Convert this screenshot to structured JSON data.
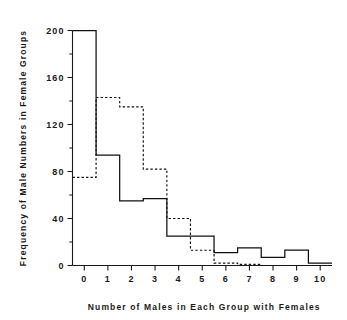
{
  "chart_data": {
    "type": "line",
    "title": "",
    "subtitle": "",
    "xlabel": "Number of Males in Each Group with Females",
    "ylabel": "Frequency of Male Numbers in Female Groups",
    "categories": [
      0,
      1,
      2,
      3,
      4,
      5,
      6,
      7,
      8,
      9,
      10
    ],
    "x": [
      0,
      1,
      2,
      3,
      4,
      5,
      6,
      7,
      8,
      9,
      10
    ],
    "xlim": [
      -0.5,
      10.5
    ],
    "ylim": [
      0,
      200
    ],
    "grid": false,
    "legend_position": "none",
    "xticks": [
      "0",
      "1",
      "2",
      "3",
      "4",
      "5",
      "6",
      "7",
      "8",
      "9",
      "10"
    ],
    "yticks": [
      "0",
      "40",
      "80",
      "120",
      "160",
      "200"
    ],
    "y_major_interval": 40,
    "y_minor_interval": 20,
    "series": [
      {
        "name": "solid",
        "style": "solid",
        "color": "#111111",
        "values": [
          200,
          94,
          55,
          57,
          25,
          25,
          11,
          15,
          7,
          13,
          2
        ]
      },
      {
        "name": "dashed",
        "style": "dashed",
        "color": "#111111",
        "values": [
          75,
          143,
          135,
          82,
          40,
          13,
          2,
          1,
          0,
          0,
          0
        ]
      }
    ]
  },
  "axes": {
    "x_title": "Number of Males in Each Group with Females",
    "y_title": "Frequency of Male Numbers in Female Groups"
  },
  "ticks": {
    "y": [
      {
        "label": "200",
        "value": 200
      },
      {
        "label": "160",
        "value": 160
      },
      {
        "label": "120",
        "value": 120
      },
      {
        "label": "80",
        "value": 80
      },
      {
        "label": "40",
        "value": 40
      },
      {
        "label": "0",
        "value": 0
      }
    ],
    "x": [
      {
        "label": "0",
        "value": 0
      },
      {
        "label": "1",
        "value": 1
      },
      {
        "label": "2",
        "value": 2
      },
      {
        "label": "3",
        "value": 3
      },
      {
        "label": "4",
        "value": 4
      },
      {
        "label": "5",
        "value": 5
      },
      {
        "label": "6",
        "value": 6
      },
      {
        "label": "7",
        "value": 7
      },
      {
        "label": "8",
        "value": 8
      },
      {
        "label": "9",
        "value": 9
      },
      {
        "label": "10",
        "value": 10
      }
    ]
  }
}
